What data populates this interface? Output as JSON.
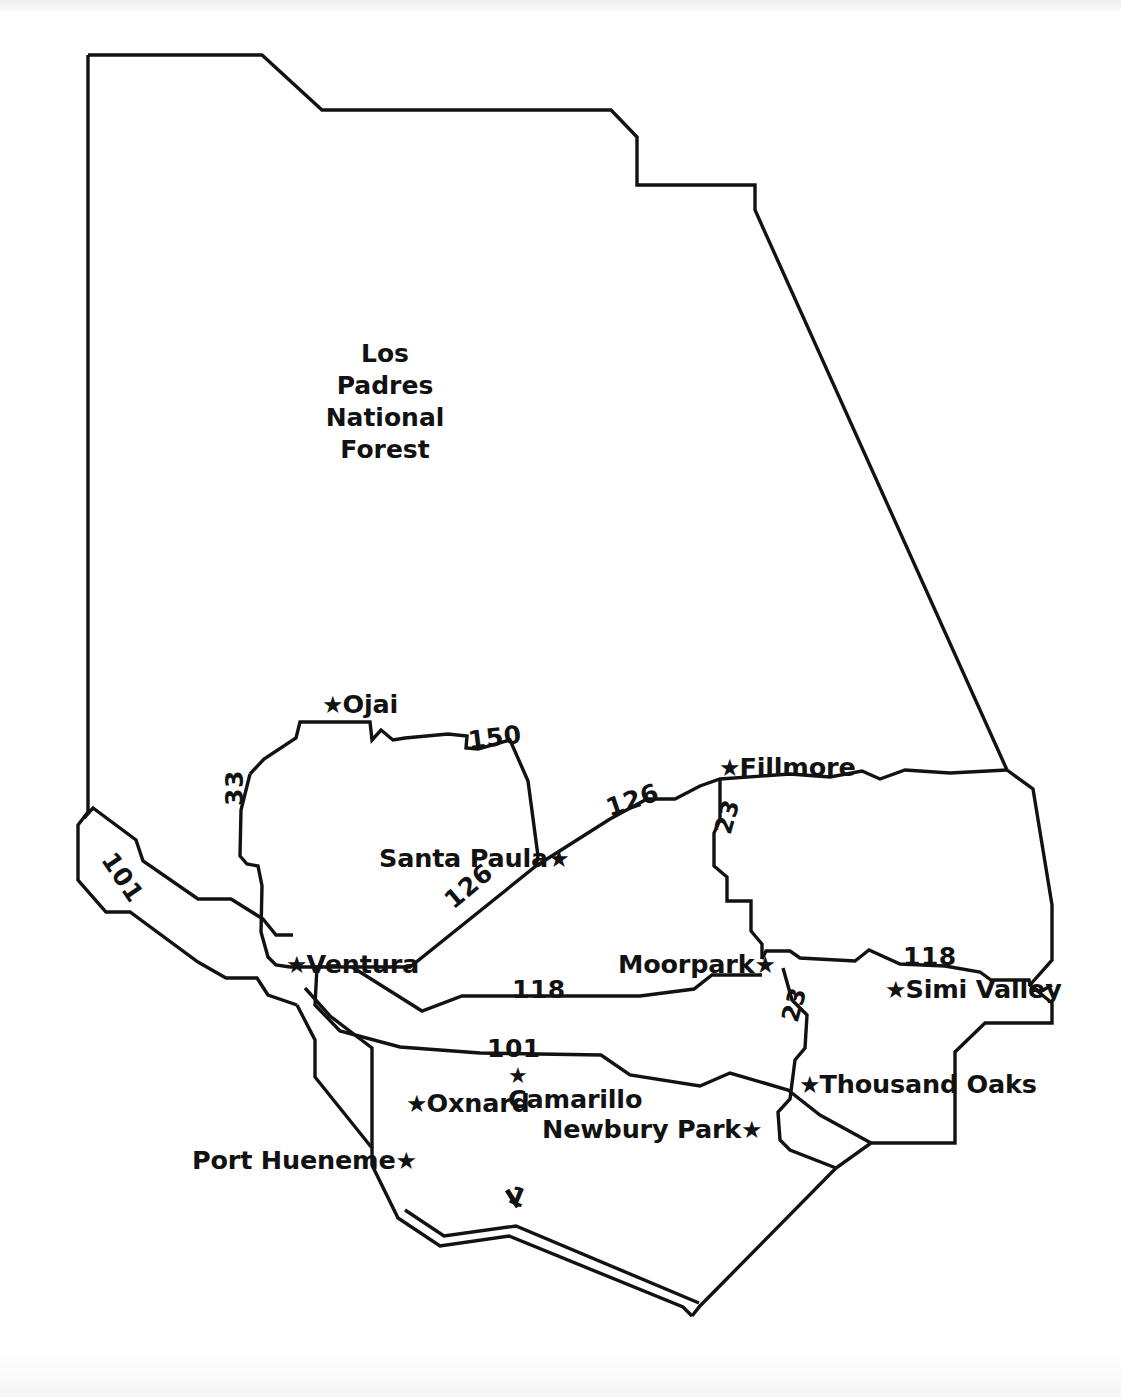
{
  "document": {
    "type": "map",
    "subject": "Ventura County, California",
    "background_color": "#ffffff",
    "ink_color": "#121212"
  },
  "map": {
    "area_labels": [
      {
        "name": "los-padres-national-forest",
        "lines": [
          "Los",
          "Padres",
          "National",
          "Forest"
        ],
        "text": "Los Padres National Forest"
      }
    ],
    "cities": [
      {
        "name": "ojai",
        "label": "Ojai",
        "star": "★",
        "star_position": "before"
      },
      {
        "name": "fillmore",
        "label": "Fillmore",
        "star": "★",
        "star_position": "before"
      },
      {
        "name": "santa-paula",
        "label": "Santa Paula",
        "star": "★",
        "star_position": "after"
      },
      {
        "name": "ventura",
        "label": "Ventura",
        "star": "★",
        "star_position": "before"
      },
      {
        "name": "moorpark",
        "label": "Moorpark",
        "star": "★",
        "star_position": "after"
      },
      {
        "name": "simi-valley",
        "label": "Simi Valley",
        "star": "★",
        "star_position": "before"
      },
      {
        "name": "thousand-oaks",
        "label": "Thousand Oaks",
        "star": "★",
        "star_position": "before"
      },
      {
        "name": "oxnard",
        "label": "Oxnard",
        "star": "★",
        "star_position": "before"
      },
      {
        "name": "camarillo",
        "label": "Camarillo",
        "star": "★",
        "star_position": "above"
      },
      {
        "name": "newbury-park",
        "label": "Newbury Park",
        "star": "★",
        "star_position": "after"
      },
      {
        "name": "port-hueneme",
        "label": "Port Hueneme",
        "star": "★",
        "star_position": "after"
      }
    ],
    "routes": [
      {
        "name": "route-150",
        "label": "150"
      },
      {
        "name": "route-33",
        "label": "33"
      },
      {
        "name": "route-101-north",
        "label": "101"
      },
      {
        "name": "route-126-east",
        "label": "126"
      },
      {
        "name": "route-126-west",
        "label": "126"
      },
      {
        "name": "route-23-north",
        "label": "23"
      },
      {
        "name": "route-23-south",
        "label": "23"
      },
      {
        "name": "route-118-west",
        "label": "118"
      },
      {
        "name": "route-118-east",
        "label": "118"
      },
      {
        "name": "route-101-south",
        "label": "101"
      },
      {
        "name": "route-1",
        "label": "1"
      }
    ]
  }
}
